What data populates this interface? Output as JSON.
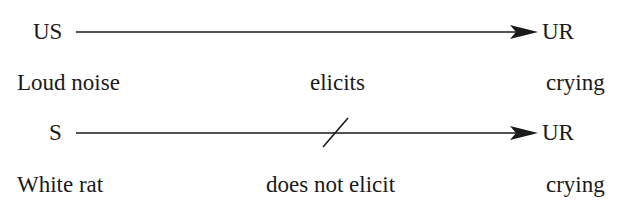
{
  "diagram": {
    "rows": [
      {
        "stimulus_abbr": "US",
        "response_abbr": "UR",
        "blocked": false,
        "stimulus_label": "Loud noise",
        "relation_label": "elicits",
        "response_label": "crying"
      },
      {
        "stimulus_abbr": "S",
        "response_abbr": "UR",
        "blocked": true,
        "stimulus_label": "White rat",
        "relation_label": "does not elicit",
        "response_label": "crying"
      }
    ],
    "colors": {
      "ink": "#1a1a1a",
      "background": "#ffffff"
    }
  }
}
